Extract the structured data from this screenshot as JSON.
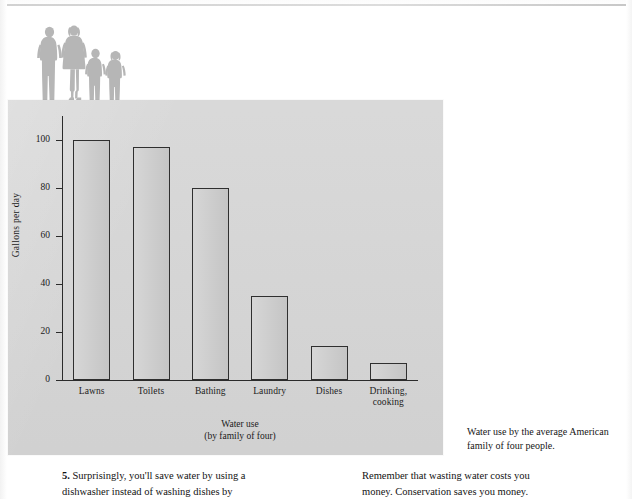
{
  "page": {
    "figure_caption": "Water use by the average American family of four people."
  },
  "chart_data": {
    "type": "bar",
    "title": "",
    "xlabel": "Water use",
    "xlabel_sub": "(by family of four)",
    "ylabel": "Gallons per day",
    "ylim": [
      0,
      110
    ],
    "yticks": [
      0,
      20,
      40,
      60,
      80,
      100
    ],
    "ytick_labels": [
      "0",
      "20",
      "40",
      "60",
      "80",
      "100"
    ],
    "grid": false,
    "legend": "none",
    "categories": [
      "Lawns",
      "Toilets",
      "Bathing",
      "Laundry",
      "Dishes",
      "Drinking, cooking"
    ],
    "category_labels": [
      {
        "line1": "Lawns",
        "line2": ""
      },
      {
        "line1": "Toilets",
        "line2": ""
      },
      {
        "line1": "Bathing",
        "line2": ""
      },
      {
        "line1": "Laundry",
        "line2": ""
      },
      {
        "line1": "Dishes",
        "line2": ""
      },
      {
        "line1": "Drinking,",
        "line2": "cooking"
      }
    ],
    "values": [
      100,
      97,
      80,
      35,
      14,
      7
    ],
    "bar_face_color": "#cbcbcb",
    "bar_edge_color": "#2f2f2f",
    "panel_color": "#d5d5d5"
  },
  "illustration": {
    "name": "family-of-four-silhouette",
    "figures": [
      "adult-man",
      "adult-woman",
      "child-one",
      "child-two"
    ],
    "color": "#b6b6b6"
  },
  "body": {
    "left_column": {
      "number": "5.",
      "line1": "Surprisingly, you'll save water by using a",
      "line2": "dishwasher instead of washing dishes by"
    },
    "right_column": {
      "line1": "Remember that wasting water costs you",
      "line2": "money. Conservation saves you money."
    }
  }
}
